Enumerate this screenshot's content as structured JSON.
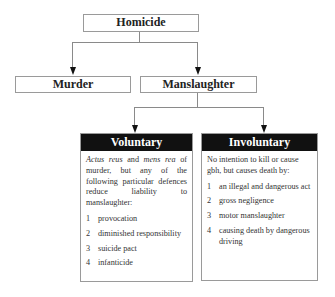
{
  "root": {
    "label": "Homicide"
  },
  "level1": [
    {
      "label": "Murder"
    },
    {
      "label": "Manslaughter"
    }
  ],
  "voluntary": {
    "title": "Voluntary",
    "intro_italic_1": "Actus reus",
    "intro_mid_1": " and ",
    "intro_italic_2": "mens rea",
    "intro_rest": " of murder, but any of the following particular defences reduce liability to manslaughter:",
    "items": [
      {
        "num": "1",
        "text": "provocation"
      },
      {
        "num": "2",
        "text": "diminished responsibility"
      },
      {
        "num": "3",
        "text": "suicide pact"
      },
      {
        "num": "4",
        "text": "infanticide"
      }
    ]
  },
  "involuntary": {
    "title": "Involuntary",
    "intro": "No intention to kill or cause gbh, but causes death by:",
    "items": [
      {
        "num": "1",
        "text": "an illegal and dangerous act"
      },
      {
        "num": "2",
        "text": "gross negligence"
      },
      {
        "num": "3",
        "text": "motor manslaughter"
      },
      {
        "num": "4",
        "text": "causing death by dangerous driving"
      }
    ]
  }
}
